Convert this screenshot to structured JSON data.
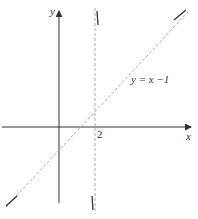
{
  "diagram": {
    "type": "function-graph-with-asymptotes",
    "axes": {
      "x_label": "x",
      "y_label": "y"
    },
    "tick_labels": {
      "x_tick": "2"
    },
    "asymptotes": {
      "vertical": {
        "x": 2,
        "style": "dashed"
      },
      "oblique": {
        "equation": "y = x −1",
        "slope": 1,
        "intercept": -1,
        "style": "dashed"
      }
    },
    "curve_branches": [
      "top-right",
      "bottom-left",
      "near-vertical-top",
      "near-vertical-bottom"
    ],
    "colors": {
      "axis": "#333333",
      "asymptote": "#999999",
      "curve": "#333333"
    }
  }
}
